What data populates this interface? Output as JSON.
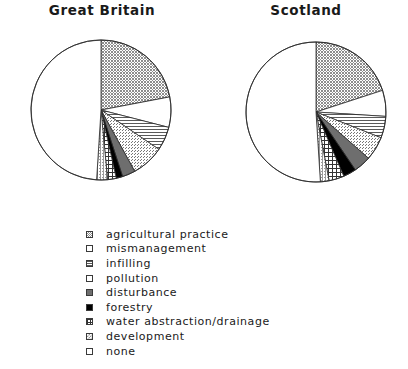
{
  "charts": [
    {
      "title": "Great Britain"
    },
    {
      "title": "Scotland"
    }
  ],
  "legend": {
    "items": [
      {
        "label": "agricultural practice",
        "pattern": "stipple-dark",
        "swatch_name": "legend-swatch-agricultural-practice"
      },
      {
        "label": "mismanagement",
        "pattern": "white",
        "swatch_name": "legend-swatch-mismanagement"
      },
      {
        "label": "infilling",
        "pattern": "horizontal",
        "swatch_name": "legend-swatch-infilling"
      },
      {
        "label": "pollution",
        "pattern": "stipple-light",
        "swatch_name": "legend-swatch-pollution"
      },
      {
        "label": "disturbance",
        "pattern": "solid-gray",
        "swatch_name": "legend-swatch-disturbance"
      },
      {
        "label": "forestry",
        "pattern": "solid-black",
        "swatch_name": "legend-swatch-forestry"
      },
      {
        "label": "water abstraction/drainage",
        "pattern": "crosshatch",
        "swatch_name": "legend-swatch-water-abstraction-drainage"
      },
      {
        "label": "development",
        "pattern": "stipple-mid",
        "swatch_name": "legend-swatch-development"
      },
      {
        "label": "none",
        "pattern": "white",
        "swatch_name": "legend-swatch-none"
      }
    ]
  },
  "chart_data": [
    {
      "type": "pie",
      "title": "Great Britain",
      "categories": [
        "agricultural practice",
        "mismanagement",
        "infilling",
        "pollution",
        "disturbance",
        "forestry",
        "water abstraction/drainage",
        "development",
        "none"
      ],
      "values": [
        22,
        7,
        5.5,
        7.5,
        3,
        1.5,
        2,
        2.5,
        49
      ],
      "unit": "percent",
      "start_angle_deg": 0,
      "direction": "clockwise",
      "patterns": [
        "stipple-dark",
        "white",
        "horizontal",
        "stipple-light",
        "solid-gray",
        "solid-black",
        "crosshatch",
        "stipple-mid",
        "white"
      ]
    },
    {
      "type": "pie",
      "title": "Scotland",
      "categories": [
        "agricultural practice",
        "mismanagement",
        "infilling",
        "pollution",
        "disturbance",
        "forestry",
        "water abstraction/drainage",
        "development",
        "none"
      ],
      "values": [
        20,
        6,
        5,
        5.5,
        4,
        3,
        3.5,
        2,
        51
      ],
      "unit": "percent",
      "start_angle_deg": 0,
      "direction": "clockwise",
      "patterns": [
        "stipple-dark",
        "white",
        "horizontal",
        "stipple-light",
        "solid-gray",
        "solid-black",
        "crosshatch",
        "stipple-mid",
        "white"
      ]
    }
  ]
}
